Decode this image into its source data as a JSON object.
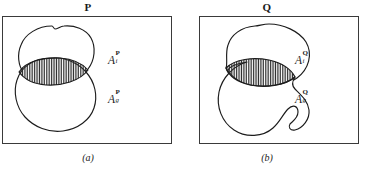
{
  "figure": {
    "panels": [
      {
        "id": "panel-a",
        "title": "P",
        "caption": "(a)",
        "labels": [
          {
            "base": "A",
            "sup": "P",
            "sub": "i"
          },
          {
            "base": "A",
            "sup": "P",
            "sub": "g"
          }
        ]
      },
      {
        "id": "panel-b",
        "title": "Q",
        "caption": "(b)",
        "labels": [
          {
            "base": "A",
            "sup": "Q",
            "sub": "i"
          },
          {
            "base": "A",
            "sup": "Q",
            "sub": "g"
          }
        ]
      }
    ],
    "colors": {
      "stroke": "#1c1c1c",
      "frame": "#3a3a3a",
      "background": "#ffffff",
      "hatch": "#2b2b2b"
    }
  }
}
